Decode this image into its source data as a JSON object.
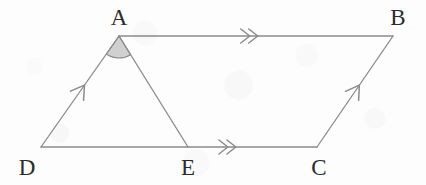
{
  "figure": {
    "kind": "geometry-diagram",
    "width": 426,
    "height": 185,
    "background_color": "#fdfdfd",
    "stroke_color": "#8a8a8a",
    "stroke_width": 1.3,
    "label_color": "#2b2b2b",
    "angle_fill_color": "#c8c8c8",
    "angle_fill_opacity": 0.85,
    "vertices": [
      {
        "id": "A",
        "label": "A",
        "x": 119,
        "y": 36,
        "label_x": 119,
        "label_y": 17
      },
      {
        "id": "B",
        "label": "B",
        "x": 393,
        "y": 36,
        "label_x": 398,
        "label_y": 17
      },
      {
        "id": "C",
        "label": "C",
        "x": 317,
        "y": 147,
        "label_x": 319,
        "label_y": 167
      },
      {
        "id": "D",
        "label": "D",
        "x": 41,
        "y": 147,
        "label_x": 27,
        "label_y": 167
      },
      {
        "id": "E",
        "label": "E",
        "x": 188,
        "y": 147,
        "label_x": 188,
        "label_y": 167
      }
    ],
    "segments": [
      {
        "id": "AB",
        "name": "segment-ab",
        "from": "A",
        "to": "B",
        "marker": "double-chevron",
        "marker_t": 0.47
      },
      {
        "id": "DC",
        "name": "segment-dc",
        "from": "D",
        "to": "C",
        "marker": "double-chevron",
        "marker_t": 0.67
      },
      {
        "id": "DA",
        "name": "segment-da",
        "from": "D",
        "to": "A",
        "marker": "single-arrow",
        "marker_t": 0.55
      },
      {
        "id": "CB",
        "name": "segment-cb",
        "from": "C",
        "to": "B",
        "marker": "single-arrow",
        "marker_t": 0.55
      },
      {
        "id": "AE",
        "name": "segment-ae",
        "from": "A",
        "to": "E",
        "marker": "none",
        "marker_t": 0.5
      }
    ],
    "angle_marks": [
      {
        "id": "angle-DAE",
        "name": "angle-mark-a",
        "vertex": "A",
        "ray_start": "D",
        "ray_end": "E",
        "radius": 22,
        "filled": true
      }
    ],
    "marker_legend": {
      "double_chevron": "≫",
      "single_arrow": "→"
    }
  }
}
